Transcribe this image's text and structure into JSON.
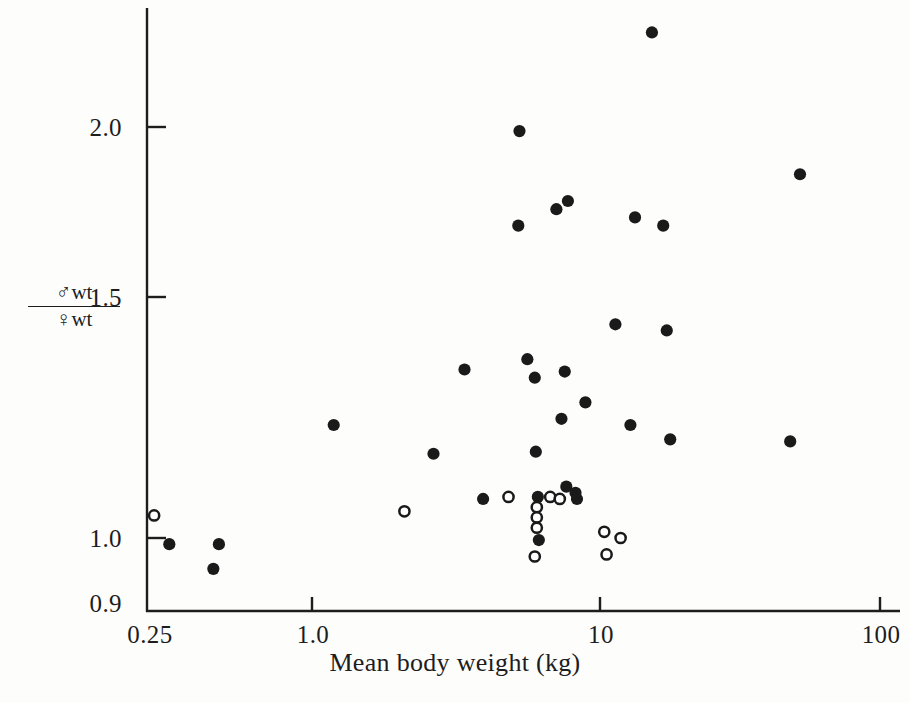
{
  "chart_data": {
    "type": "scatter",
    "title": "",
    "xlabel": "Mean body weight (kg)",
    "ylabel_numerator": "♂wt",
    "ylabel_denominator": "♀wt",
    "xscale": "log",
    "yscale": "linear",
    "xlim": [
      0.25,
      130
    ],
    "ylim": [
      0.9,
      2.28
    ],
    "grid": false,
    "legend": "none",
    "xticks": [
      {
        "value": 0.25,
        "label": "0.25"
      },
      {
        "value": 1.0,
        "label": "1.0"
      },
      {
        "value": 10,
        "label": "10"
      },
      {
        "value": 100,
        "label": "100"
      }
    ],
    "yticks": [
      {
        "value": 2.0,
        "label": "2.0"
      },
      {
        "value": 1.5,
        "label": "1.5"
      },
      {
        "value": 1.0,
        "label": "1.0"
      },
      {
        "value": 0.9,
        "label": "0.9"
      }
    ],
    "series": [
      {
        "name": "filled-circle",
        "marker": "filled-circle",
        "color": "#1a1a1a",
        "points": [
          {
            "x": 0.3,
            "y": 0.985
          },
          {
            "x": 0.45,
            "y": 0.985
          },
          {
            "x": 0.43,
            "y": 0.925
          },
          {
            "x": 1.15,
            "y": 1.275
          },
          {
            "x": 2.6,
            "y": 1.205
          },
          {
            "x": 3.35,
            "y": 1.41
          },
          {
            "x": 3.9,
            "y": 1.095
          },
          {
            "x": 5.2,
            "y": 1.76
          },
          {
            "x": 5.25,
            "y": 1.99
          },
          {
            "x": 5.6,
            "y": 1.435
          },
          {
            "x": 5.95,
            "y": 1.39
          },
          {
            "x": 6.0,
            "y": 1.21
          },
          {
            "x": 6.1,
            "y": 1.1
          },
          {
            "x": 6.15,
            "y": 0.995
          },
          {
            "x": 7.1,
            "y": 1.8
          },
          {
            "x": 7.8,
            "y": 1.82
          },
          {
            "x": 7.6,
            "y": 1.405
          },
          {
            "x": 7.4,
            "y": 1.29
          },
          {
            "x": 7.7,
            "y": 1.125
          },
          {
            "x": 8.4,
            "y": 1.095
          },
          {
            "x": 8.3,
            "y": 1.11
          },
          {
            "x": 9.0,
            "y": 1.33
          },
          {
            "x": 11.5,
            "y": 1.52
          },
          {
            "x": 13.5,
            "y": 1.78
          },
          {
            "x": 13.0,
            "y": 1.275
          },
          {
            "x": 15.5,
            "y": 2.23
          },
          {
            "x": 17.0,
            "y": 1.76
          },
          {
            "x": 17.5,
            "y": 1.505
          },
          {
            "x": 18.0,
            "y": 1.24
          },
          {
            "x": 48.0,
            "y": 1.235
          },
          {
            "x": 52.0,
            "y": 1.885
          }
        ]
      },
      {
        "name": "open-circle",
        "marker": "open-circle",
        "color": "#1a1a1a",
        "points": [
          {
            "x": 0.265,
            "y": 1.055
          },
          {
            "x": 2.05,
            "y": 1.065
          },
          {
            "x": 4.8,
            "y": 1.1
          },
          {
            "x": 6.05,
            "y": 1.075
          },
          {
            "x": 6.05,
            "y": 1.05
          },
          {
            "x": 6.05,
            "y": 1.025
          },
          {
            "x": 5.95,
            "y": 0.955
          },
          {
            "x": 6.75,
            "y": 1.1
          },
          {
            "x": 7.3,
            "y": 1.095
          },
          {
            "x": 10.5,
            "y": 1.015
          },
          {
            "x": 12.0,
            "y": 1.0
          },
          {
            "x": 10.7,
            "y": 0.96
          }
        ]
      }
    ]
  }
}
